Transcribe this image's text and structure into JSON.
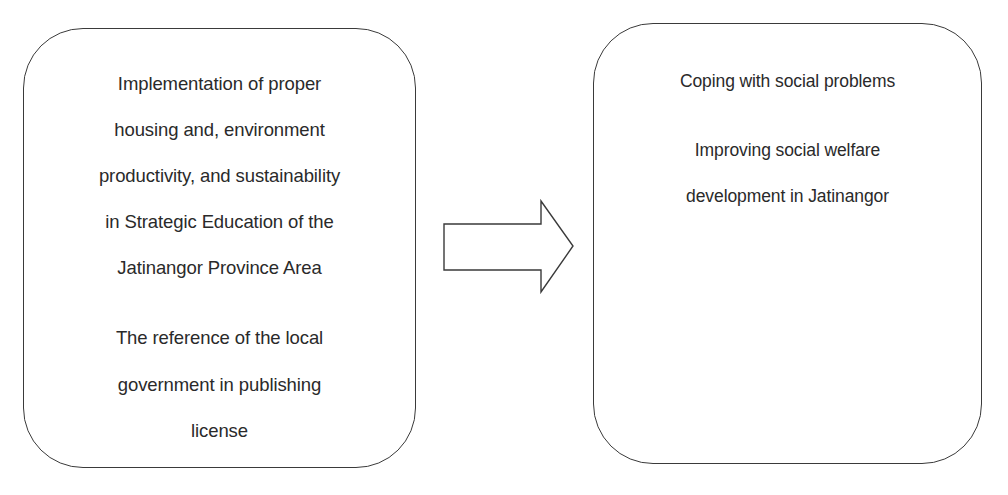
{
  "diagram": {
    "type": "flow",
    "source_box": {
      "paragraphs": [
        {
          "lines": [
            "Implementation  of proper",
            "housing and, environment",
            "productivity, and sustainability",
            "in Strategic Education of the",
            "Jatinangor Province Area"
          ]
        },
        {
          "lines": [
            "The reference of the local",
            "government in publishing",
            "license"
          ]
        }
      ]
    },
    "connector": {
      "shape": "block-arrow-right",
      "direction": "left-to-right",
      "fill": "#ffffff",
      "stroke": "#3a3a3a"
    },
    "target_box": {
      "paragraphs": [
        {
          "lines": [
            "Coping with social problems"
          ]
        },
        {
          "lines": [
            "Improving  social welfare",
            "development in Jatinangor"
          ]
        }
      ]
    },
    "colors": {
      "background": "#ffffff",
      "border": "#3a3a3a",
      "text": "#2a2a2a"
    }
  }
}
